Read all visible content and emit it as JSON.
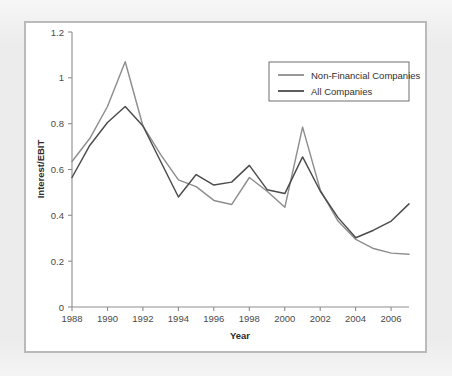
{
  "figure": {
    "background_color": "#ececed",
    "panel_color": "#ffffff",
    "panel_border_color": "#b9babc"
  },
  "chart_data": {
    "type": "line",
    "title": "",
    "xlabel": "Year",
    "ylabel": "Interest/EBIT",
    "xlim": [
      1988,
      2007
    ],
    "ylim": [
      0,
      1.2
    ],
    "yticks": [
      0,
      0.2,
      0.4,
      0.6,
      0.8,
      1,
      1.2
    ],
    "ytick_labels": [
      "0",
      "0.2",
      "0.4",
      "0.6",
      "0.8",
      "1",
      "1.2"
    ],
    "xticks": [
      1988,
      1990,
      1992,
      1994,
      1996,
      1998,
      2000,
      2002,
      2004,
      2006
    ],
    "xtick_labels": [
      "1988",
      "1990",
      "1992",
      "1994",
      "1996",
      "1998",
      "2000",
      "2002",
      "2004",
      "2006"
    ],
    "grid": false,
    "legend_position": "upper right",
    "x": [
      1988,
      1989,
      1990,
      1991,
      1992,
      1993,
      1994,
      1995,
      1996,
      1997,
      1998,
      1999,
      2000,
      2001,
      2002,
      2003,
      2004,
      2005,
      2006,
      2007
    ],
    "series": [
      {
        "name": "Non-Financial Companies",
        "color": "#8e8e90",
        "values": [
          0.635,
          0.735,
          0.875,
          1.07,
          0.79,
          0.665,
          0.555,
          0.525,
          0.465,
          0.447,
          0.565,
          0.505,
          0.435,
          0.785,
          0.51,
          0.375,
          0.295,
          0.255,
          0.235,
          0.23
        ]
      },
      {
        "name": "All Companies",
        "color": "#4b4b4d",
        "values": [
          0.565,
          0.705,
          0.805,
          0.875,
          0.79,
          0.635,
          0.48,
          0.578,
          0.532,
          0.545,
          0.618,
          0.512,
          0.495,
          0.655,
          0.505,
          0.39,
          0.302,
          0.335,
          0.375,
          0.45
        ]
      }
    ]
  },
  "legend": {
    "entries": [
      {
        "label": "Non-Financial Companies",
        "color": "#8e8e90"
      },
      {
        "label": "All Companies",
        "color": "#4b4b4d"
      }
    ]
  }
}
